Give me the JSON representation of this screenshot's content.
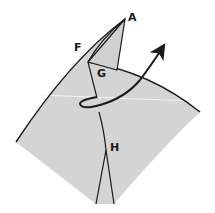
{
  "diagram": {
    "type": "origami-step",
    "paper_color": "#d9d9d9",
    "line_color": "#1a1a1a",
    "labels": {
      "A": "A",
      "F": "F",
      "G": "G",
      "H": "H"
    },
    "arrow": {
      "type": "wrap-around-arrow",
      "direction": "up-right"
    }
  }
}
